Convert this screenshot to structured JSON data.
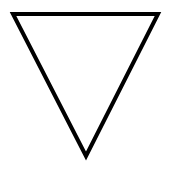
{
  "diagram": {
    "shape": "triangle-down",
    "stroke_color": "#000000",
    "fill_color": "#ffffff",
    "background_color": "#ffffff",
    "stroke_width": 4,
    "vertices": [
      [
        13,
        14
      ],
      [
        158,
        14
      ],
      [
        86,
        156
      ]
    ]
  }
}
